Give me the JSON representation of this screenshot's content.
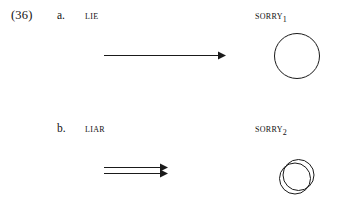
{
  "figure": {
    "example_number": "(36)",
    "rows": [
      {
        "letter": "a.",
        "source_label": "LIE",
        "target_label": "SORRY",
        "target_subscript": "1",
        "arrow_type": "single-arrow",
        "diagram_type": "single-circle",
        "arrow_count": 1,
        "circle_count": 1
      },
      {
        "letter": "b.",
        "source_label": "LIAR",
        "target_label": "SORRY",
        "target_subscript": "2",
        "arrow_type": "double-arrow",
        "diagram_type": "double-circle",
        "arrow_count": 2,
        "circle_count": 2
      }
    ]
  },
  "style": {
    "ink_color": "#1a1a1a",
    "background_color": "#ffffff"
  }
}
